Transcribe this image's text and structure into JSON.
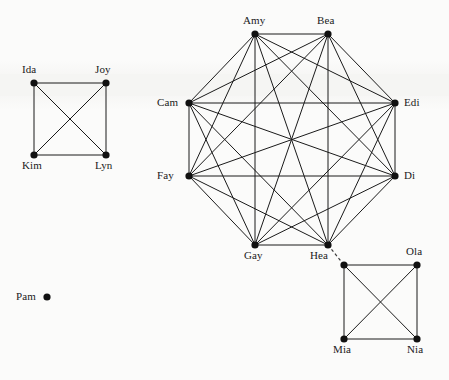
{
  "diagram": {
    "background_color": "#fbfbfa",
    "node_color": "#111111",
    "edge_color": "#1a1a1a",
    "node_radius": 3.6,
    "components": [
      {
        "id": "component-left-square",
        "kind": "complete-graph-k4",
        "node_count": 4,
        "edge_count": 6
      },
      {
        "id": "component-center-octagon",
        "kind": "complete-graph-k8",
        "node_count": 8,
        "edge_count": 28
      },
      {
        "id": "component-right-square",
        "kind": "complete-graph-k4",
        "node_count": 4,
        "edge_count": 6
      },
      {
        "id": "component-isolated",
        "kind": "isolated-vertex",
        "node_count": 1,
        "edge_count": 0
      }
    ],
    "nodes": [
      {
        "id": "ida",
        "label": "Ida",
        "x": 34,
        "y": 83,
        "label_x": 22,
        "label_y": 64,
        "component": "component-left-square"
      },
      {
        "id": "joy",
        "label": "Joy",
        "x": 106,
        "y": 83,
        "label_x": 95,
        "label_y": 64,
        "component": "component-left-square"
      },
      {
        "id": "kim",
        "label": "Kim",
        "x": 34,
        "y": 155,
        "label_x": 22,
        "label_y": 160,
        "component": "component-left-square"
      },
      {
        "id": "lyn",
        "label": "Lyn",
        "x": 106,
        "y": 155,
        "label_x": 95,
        "label_y": 160,
        "component": "component-left-square"
      },
      {
        "id": "amy",
        "label": "Amy",
        "x": 255,
        "y": 34,
        "label_x": 243,
        "label_y": 15,
        "component": "component-center-octagon"
      },
      {
        "id": "bea",
        "label": "Bea",
        "x": 328,
        "y": 34,
        "label_x": 317,
        "label_y": 15,
        "component": "component-center-octagon"
      },
      {
        "id": "edi",
        "label": "Edi",
        "x": 395,
        "y": 103,
        "label_x": 404,
        "label_y": 97,
        "component": "component-center-octagon"
      },
      {
        "id": "di",
        "label": "Di",
        "x": 395,
        "y": 176,
        "label_x": 404,
        "label_y": 170,
        "component": "component-center-octagon"
      },
      {
        "id": "hea",
        "label": "Hea",
        "x": 328,
        "y": 245,
        "label_x": 310,
        "label_y": 250,
        "component": "component-center-octagon"
      },
      {
        "id": "gay",
        "label": "Gay",
        "x": 255,
        "y": 245,
        "label_x": 244,
        "label_y": 250,
        "component": "component-center-octagon"
      },
      {
        "id": "fay",
        "label": "Fay",
        "x": 189,
        "y": 176,
        "label_x": 157,
        "label_y": 170,
        "component": "component-center-octagon"
      },
      {
        "id": "cam",
        "label": "Cam",
        "x": 189,
        "y": 103,
        "label_x": 157,
        "label_y": 97,
        "component": "component-center-octagon"
      },
      {
        "id": "unlabeled-ne",
        "label": "",
        "x": 344,
        "y": 265,
        "label_x": 334,
        "label_y": 250,
        "component": "component-right-square"
      },
      {
        "id": "ola",
        "label": "Ola",
        "x": 417,
        "y": 265,
        "label_x": 406,
        "label_y": 246,
        "component": "component-right-square"
      },
      {
        "id": "mia",
        "label": "Mia",
        "x": 344,
        "y": 339,
        "label_x": 333,
        "label_y": 344,
        "component": "component-right-square"
      },
      {
        "id": "nia",
        "label": "Nia",
        "x": 417,
        "y": 339,
        "label_x": 407,
        "label_y": 344,
        "component": "component-right-square"
      },
      {
        "id": "pam",
        "label": "Pam",
        "x": 47,
        "y": 297,
        "label_x": 16,
        "label_y": 291,
        "component": "component-isolated"
      }
    ],
    "edges": [
      {
        "from": "ida",
        "to": "joy",
        "style": "solid"
      },
      {
        "from": "ida",
        "to": "kim",
        "style": "solid"
      },
      {
        "from": "ida",
        "to": "lyn",
        "style": "solid"
      },
      {
        "from": "joy",
        "to": "kim",
        "style": "solid"
      },
      {
        "from": "joy",
        "to": "lyn",
        "style": "solid"
      },
      {
        "from": "kim",
        "to": "lyn",
        "style": "solid"
      },
      {
        "from": "amy",
        "to": "bea",
        "style": "solid"
      },
      {
        "from": "amy",
        "to": "edi",
        "style": "solid"
      },
      {
        "from": "amy",
        "to": "di",
        "style": "solid"
      },
      {
        "from": "amy",
        "to": "hea",
        "style": "solid"
      },
      {
        "from": "amy",
        "to": "gay",
        "style": "solid"
      },
      {
        "from": "amy",
        "to": "fay",
        "style": "solid"
      },
      {
        "from": "amy",
        "to": "cam",
        "style": "solid"
      },
      {
        "from": "bea",
        "to": "edi",
        "style": "solid"
      },
      {
        "from": "bea",
        "to": "di",
        "style": "solid"
      },
      {
        "from": "bea",
        "to": "hea",
        "style": "solid"
      },
      {
        "from": "bea",
        "to": "gay",
        "style": "solid"
      },
      {
        "from": "bea",
        "to": "fay",
        "style": "solid"
      },
      {
        "from": "bea",
        "to": "cam",
        "style": "solid"
      },
      {
        "from": "edi",
        "to": "di",
        "style": "solid"
      },
      {
        "from": "edi",
        "to": "hea",
        "style": "solid"
      },
      {
        "from": "edi",
        "to": "gay",
        "style": "solid"
      },
      {
        "from": "edi",
        "to": "fay",
        "style": "solid"
      },
      {
        "from": "edi",
        "to": "cam",
        "style": "solid"
      },
      {
        "from": "di",
        "to": "hea",
        "style": "solid"
      },
      {
        "from": "di",
        "to": "gay",
        "style": "solid"
      },
      {
        "from": "di",
        "to": "fay",
        "style": "solid"
      },
      {
        "from": "di",
        "to": "cam",
        "style": "solid"
      },
      {
        "from": "hea",
        "to": "gay",
        "style": "solid"
      },
      {
        "from": "hea",
        "to": "fay",
        "style": "solid"
      },
      {
        "from": "hea",
        "to": "cam",
        "style": "solid"
      },
      {
        "from": "gay",
        "to": "fay",
        "style": "solid"
      },
      {
        "from": "gay",
        "to": "cam",
        "style": "solid"
      },
      {
        "from": "fay",
        "to": "cam",
        "style": "solid"
      },
      {
        "from": "unlabeled-ne",
        "to": "ola",
        "style": "solid"
      },
      {
        "from": "unlabeled-ne",
        "to": "mia",
        "style": "solid"
      },
      {
        "from": "unlabeled-ne",
        "to": "nia",
        "style": "solid"
      },
      {
        "from": "ola",
        "to": "mia",
        "style": "solid"
      },
      {
        "from": "ola",
        "to": "nia",
        "style": "solid"
      },
      {
        "from": "mia",
        "to": "nia",
        "style": "solid"
      },
      {
        "from": "hea",
        "to": "unlabeled-ne",
        "style": "dashed"
      }
    ]
  }
}
